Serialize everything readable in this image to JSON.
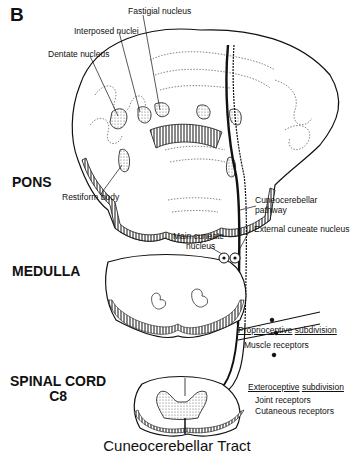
{
  "figure": {
    "panel_letter": "B",
    "title": "Cuneocerebellar Tract"
  },
  "regions": {
    "pons": "PONS",
    "medulla": "MEDULLA",
    "spinal_cord_line1": "SPINAL CORD",
    "spinal_cord_line2": "C8"
  },
  "labels": {
    "fastigial_nucleus": "Fastigial nucleus",
    "interposed_nuclei": "Interposed nuclei",
    "dentate_nucleus": "Dentate nucleus",
    "restiform_body": "Restiform body",
    "cuneocerebellar_pathway_line1": "Cuneocerebellar",
    "cuneocerebellar_pathway_line2": "pathway",
    "main_cuneate_nucleus_line1": "Main cuneate",
    "main_cuneate_nucleus_line2": "nucleus",
    "external_cuneate_nucleus": "External cuneate nucleus",
    "proprioceptive_word": "Proprioceptive",
    "proprioceptive_sub": "subdivision",
    "muscle_receptors": "Muscle receptors",
    "exteroceptive_word": "Exteroceptive",
    "exteroceptive_sub": "subdivision",
    "joint_receptors": "Joint receptors",
    "cutaneous_receptors": "Cutaneous receptors"
  },
  "colors": {
    "ink": "#111111",
    "background": "#ffffff",
    "stipple": "#bdbdbd"
  }
}
